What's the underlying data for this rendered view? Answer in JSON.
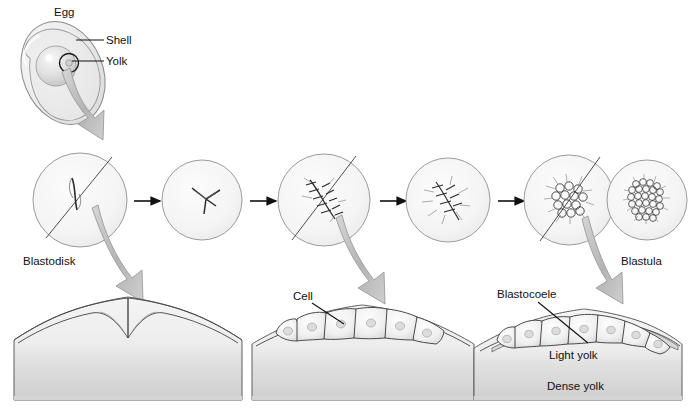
{
  "figure": {
    "background_color": "#ffffff",
    "ink_color": "#1b1b1b",
    "fill_light": "#f2f2f2",
    "fill_mid": "#dcdcdc",
    "fill_dark": "#c2c2c2",
    "arrow_gray": "#b9b9b9",
    "outline_color": "#6e6e6e"
  },
  "egg": {
    "label": "Egg",
    "shell_label": "Shell",
    "yolk_label": "Yolk"
  },
  "stages": {
    "blastodisk_label": "Blastodisk",
    "blastula_label": "Blastula",
    "circles": [
      {
        "name": "blastodisk-stage",
        "cells": "1",
        "section_line": true
      },
      {
        "name": "two-cell-stage",
        "cells": "2-4",
        "section_line": false
      },
      {
        "name": "early-cleavage-stage",
        "cells": "8-16",
        "section_line": true
      },
      {
        "name": "mid-cleavage-stage",
        "cells": "16-32",
        "section_line": false
      },
      {
        "name": "late-cleavage-stage",
        "cells": "many",
        "section_line": true
      },
      {
        "name": "blastula-stage",
        "cells": "blastula",
        "section_line": false
      }
    ]
  },
  "sections": {
    "cell_label": "Cell",
    "blastocoele_label": "Blastocoele",
    "light_yolk_label": "Light yolk",
    "dense_yolk_label": "Dense yolk",
    "panels": [
      {
        "name": "section-panel-1",
        "caption": ""
      },
      {
        "name": "section-panel-2",
        "caption": "Cell"
      },
      {
        "name": "section-panel-3",
        "caption": "Blastocoele"
      }
    ]
  }
}
